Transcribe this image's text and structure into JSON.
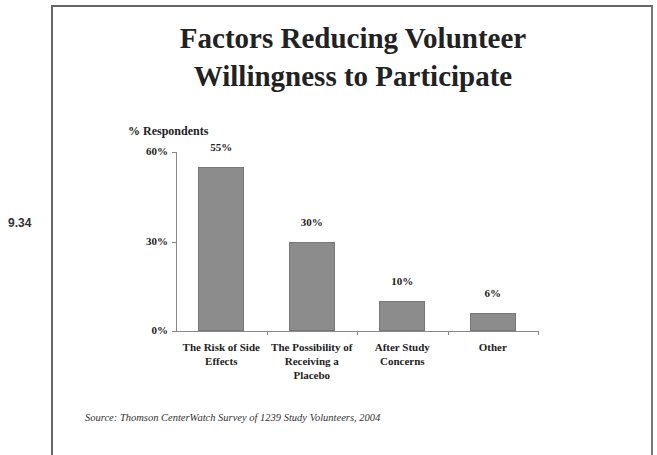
{
  "slide": {
    "number": "9.34",
    "title_line1": "Factors Reducing Volunteer",
    "title_line2": "Willingness to Participate",
    "source": "Source: Thomson CenterWatch Survey of 1239 Study Volunteers, 2004"
  },
  "chart_data": {
    "type": "bar",
    "title": "Factors Reducing Volunteer Willingness to Participate",
    "xlabel": "",
    "ylabel": "% Respondents",
    "categories": [
      "The Risk of Side Effects",
      "The Possibility of Receiving a Placebo",
      "After Study Concerns",
      "Other"
    ],
    "category_lines": [
      [
        "The Risk of Side",
        "Effects"
      ],
      [
        "The Possibility of",
        "Receiving a",
        "Placebo"
      ],
      [
        "After Study",
        "Concerns"
      ],
      [
        "Other"
      ]
    ],
    "values": [
      55,
      30,
      10,
      6
    ],
    "value_labels": [
      "55%",
      "30%",
      "10%",
      "6%"
    ],
    "yticks": [
      "0%",
      "30%",
      "60%"
    ],
    "ylim": [
      0,
      60
    ],
    "grid": false,
    "legend": null,
    "bar_color": "#8c8c8c"
  }
}
